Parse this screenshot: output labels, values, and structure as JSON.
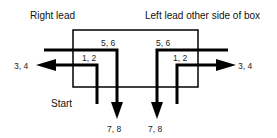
{
  "diagram": {
    "titles": {
      "right_lead": "Right lead",
      "left_lead": "Left lead other side of box"
    },
    "start_label": "Start",
    "left_side": {
      "outer_wire_label": "5, 6",
      "inner_wire_label": "1, 2",
      "side_exit_label": "3, 4",
      "bottom_exit_label": "7, 8"
    },
    "right_side": {
      "outer_wire_label": "5, 6",
      "inner_wire_label": "1, 2",
      "side_exit_label": "3, 4",
      "bottom_exit_label": "7, 8"
    },
    "colors": {
      "line": "#000000",
      "text": "#111111"
    }
  }
}
